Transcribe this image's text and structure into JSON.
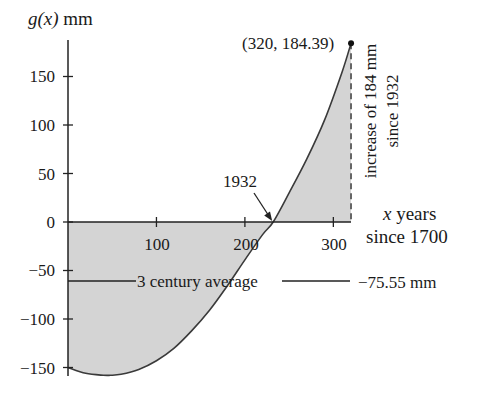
{
  "chart_data": {
    "type": "area",
    "title": "",
    "ylabel_prefix": "g(x)",
    "ylabel_unit": "mm",
    "xlabel_line1_var": "x",
    "xlabel_line1_rest": "years",
    "xlabel_line2": "since 1700",
    "xlim": [
      0,
      320
    ],
    "ylim": [
      -160,
      190
    ],
    "x_ticks": [
      100,
      200,
      300
    ],
    "y_ticks": [
      150,
      100,
      50,
      0,
      -50,
      -100,
      -150
    ],
    "y_tick_labels": [
      "150",
      "100",
      "50",
      "0",
      "−50",
      "−100",
      "−150"
    ],
    "x_tick_labels": [
      "100",
      "200",
      "300"
    ],
    "grid": false,
    "legend": null,
    "series": [
      {
        "name": "g(x)",
        "x": [
          0,
          20,
          40,
          48,
          60,
          80,
          100,
          120,
          140,
          160,
          180,
          200,
          220,
          232,
          250,
          270,
          290,
          310,
          320
        ],
        "y": [
          -150,
          -156,
          -158,
          -158,
          -157,
          -152,
          -143,
          -130,
          -112,
          -91,
          -66,
          -39,
          -13,
          0,
          30,
          65,
          105,
          155,
          184.39
        ],
        "fill": "shaded area between curve and x-axis"
      }
    ],
    "annotations": {
      "endpoint_label": "(320, 184.39)",
      "endpoint": [
        320,
        184.39
      ],
      "zero_crossing_label": "1932",
      "zero_crossing_x": 232,
      "increase_label_line1": "increase of 184 mm",
      "increase_label_line2": "since 1932",
      "average_label": "3 century average",
      "average_value_label": "−75.55 mm",
      "average_value": -75.55
    },
    "colors": {
      "fill": "#d3d3d3",
      "line": "#333333",
      "axis": "#222222"
    }
  }
}
